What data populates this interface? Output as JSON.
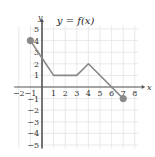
{
  "chart_data": {
    "type": "line",
    "title": "y = f(x)",
    "xlabel": "x",
    "ylabel": "y",
    "xlim": [
      -2,
      8
    ],
    "ylim": [
      -5,
      5
    ],
    "grid": true,
    "x_ticks": [
      -2,
      -1,
      1,
      2,
      3,
      4,
      5,
      6,
      7,
      8
    ],
    "y_ticks": [
      5,
      4,
      3,
      2,
      1,
      -1,
      -2,
      -3,
      -4,
      -5
    ],
    "series": [
      {
        "name": "f(x)",
        "points": [
          [
            -1,
            4
          ],
          [
            0,
            2.5
          ],
          [
            1,
            1
          ],
          [
            3,
            1
          ],
          [
            4,
            2
          ],
          [
            7,
            -1
          ]
        ],
        "endpoints": [
          {
            "x": -1,
            "y": 4,
            "closed": true
          },
          {
            "x": 7,
            "y": -1,
            "closed": true
          }
        ]
      }
    ]
  },
  "colors": {
    "grid": "#e3e3e3",
    "axis": "#555555",
    "curve": "#888888",
    "dot": "#8a8a8a"
  }
}
